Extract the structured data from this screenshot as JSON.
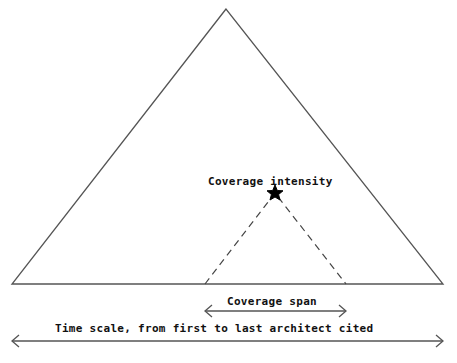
{
  "diagram": {
    "labels": {
      "intensity": "Coverage intensity",
      "span": "Coverage span",
      "timescale": "Time scale, from first to last architect cited"
    },
    "icons": {
      "star": "star-icon"
    },
    "colors": {
      "line": "#555555",
      "text": "#111111",
      "background": "#ffffff"
    }
  }
}
